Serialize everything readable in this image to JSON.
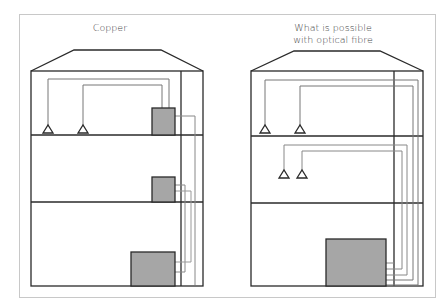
{
  "diagram": {
    "panels": [
      {
        "id": "copper",
        "title": "Copper",
        "floors": 3,
        "devices": [
          "antenna",
          "antenna",
          "small-box",
          "small-box",
          "large-box"
        ]
      },
      {
        "id": "optical-fibre",
        "title": "What is possible with optical fibre",
        "title_lines": [
          "What is possible",
          "with optical fibre"
        ],
        "floors": 3,
        "devices": [
          "antenna",
          "antenna",
          "antenna",
          "antenna",
          "large-box"
        ]
      }
    ],
    "colors": {
      "wall": "#2a2a2a",
      "cable": "#888888",
      "box_fill": "#a6a6a6",
      "frame": "#c8c8c8"
    }
  }
}
